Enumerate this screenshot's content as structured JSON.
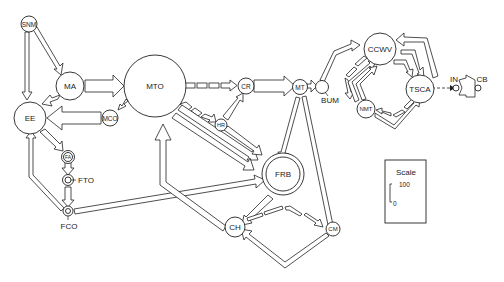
{
  "diagram": {
    "type": "flux network",
    "nodes": [
      {
        "id": "SNM",
        "label": "SNM"
      },
      {
        "id": "MA",
        "label": "MA"
      },
      {
        "id": "EE",
        "label": "EE"
      },
      {
        "id": "MCO",
        "label": "MCO"
      },
      {
        "id": "MTO",
        "label": "MTO"
      },
      {
        "id": "FA",
        "label": "FA"
      },
      {
        "id": "FTO",
        "label": "FTO"
      },
      {
        "id": "FCO",
        "label": "FCO"
      },
      {
        "id": "CR",
        "label": "CR"
      },
      {
        "id": "HR",
        "label": "HR"
      },
      {
        "id": "MT",
        "label": "MT"
      },
      {
        "id": "BUM",
        "label": "BUM"
      },
      {
        "id": "FRB",
        "label": "FRB"
      },
      {
        "id": "CH",
        "label": "CH"
      },
      {
        "id": "CM",
        "label": "CM"
      },
      {
        "id": "CCWV",
        "label": "CCWV"
      },
      {
        "id": "TSCA",
        "label": "TSCA"
      },
      {
        "id": "NMT",
        "label": "NMT"
      },
      {
        "id": "IN",
        "label": "IN"
      },
      {
        "id": "CB",
        "label": "CB"
      }
    ],
    "edges": [
      {
        "from": "SNM",
        "to": "MA",
        "style": "solid"
      },
      {
        "from": "SNM",
        "to": "EE",
        "style": "solid"
      },
      {
        "from": "MA",
        "to": "MTO",
        "style": "solid"
      },
      {
        "from": "MA",
        "to": "EE",
        "style": "solid"
      },
      {
        "from": "MCO",
        "to": "EE",
        "style": "solid"
      },
      {
        "from": "MTO",
        "to": "MCO",
        "style": "dashed"
      },
      {
        "from": "EE",
        "to": "FA",
        "style": "solid"
      },
      {
        "from": "FA",
        "to": "FTO",
        "style": "solid"
      },
      {
        "from": "FTO",
        "to": "FCO",
        "style": "solid"
      },
      {
        "from": "FCO",
        "to": "EE",
        "style": "solid"
      },
      {
        "from": "FCO",
        "to": "FRB",
        "style": "solid"
      },
      {
        "from": "MTO",
        "to": "CR",
        "style": "dashed"
      },
      {
        "from": "MTO",
        "to": "HR",
        "style": "dashed"
      },
      {
        "from": "HR",
        "to": "CR",
        "style": "solid"
      },
      {
        "from": "MTO",
        "to": "FRB",
        "style": "solid"
      },
      {
        "from": "HR",
        "to": "FRB",
        "style": "solid"
      },
      {
        "from": "CR",
        "to": "MT",
        "style": "solid"
      },
      {
        "from": "MT",
        "to": "BUM",
        "style": "solid"
      },
      {
        "from": "MT",
        "to": "FRB",
        "style": "solid"
      },
      {
        "from": "MT",
        "to": "CM",
        "style": "solid"
      },
      {
        "from": "FRB",
        "to": "CH",
        "style": "solid"
      },
      {
        "from": "CH",
        "to": "MTO",
        "style": "solid"
      },
      {
        "from": "CH",
        "to": "CM",
        "style": "dashed"
      },
      {
        "from": "CM",
        "to": "CH",
        "style": "solid"
      },
      {
        "from": "BUM",
        "to": "CCWV",
        "style": "solid"
      },
      {
        "from": "CCWV",
        "to": "TSCA",
        "style": "solid"
      },
      {
        "from": "TSCA",
        "to": "CCWV",
        "style": "solid"
      },
      {
        "from": "CCWV",
        "to": "NMT",
        "style": "dashed"
      },
      {
        "from": "NMT",
        "to": "CCWV",
        "style": "solid"
      },
      {
        "from": "NMT",
        "to": "TSCA",
        "style": "solid"
      },
      {
        "from": "TSCA",
        "to": "NMT",
        "style": "dashed"
      },
      {
        "from": "TSCA",
        "to": "IN",
        "style": "dashed"
      },
      {
        "from": "IN",
        "to": "CB",
        "style": "solid"
      }
    ]
  },
  "scale": {
    "title": "Scale",
    "max": "100",
    "min": "0"
  }
}
